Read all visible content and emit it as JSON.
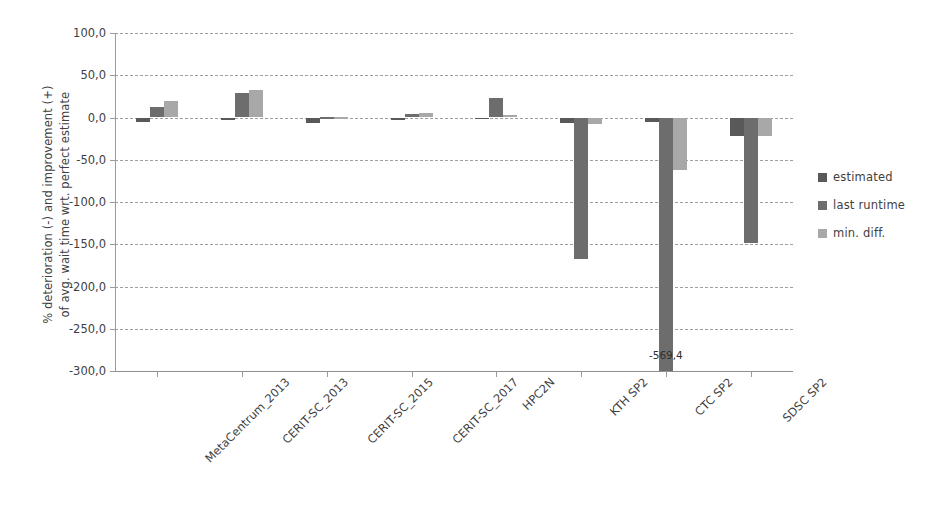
{
  "chart_data": {
    "type": "bar",
    "title": "",
    "xlabel": "",
    "ylabel_line1": "% deterioration (-) and improvement (+)",
    "ylabel_line2": "of  avg. wait time wrt. perfect estimate",
    "ylim": [
      -300.0,
      100.0
    ],
    "ytick_step": 50.0,
    "ytick_labels": [
      "100,0",
      "50,0",
      "0,0",
      "-50,0",
      "-100,0",
      "-150,0",
      "-200,0",
      "-250,0",
      "-300,0"
    ],
    "ytick_values": [
      100.0,
      50.0,
      0.0,
      -50.0,
      -100.0,
      -150.0,
      -200.0,
      -250.0,
      -300.0
    ],
    "grid": true,
    "grid_style": "dashed",
    "legend_position": "right",
    "decimal_separator": ",",
    "categories": [
      "MetaCentrum_2013",
      "CERIT-SC_2013",
      "CERIT-SC_2015",
      "CERIT-SC_2017",
      "HPC2N",
      "KTH SP2",
      "CTC SP2",
      "SDSC SP2"
    ],
    "series": [
      {
        "name": "estimated",
        "color": "#595959",
        "values": [
          -5.0,
          -2.5,
          -6.5,
          -2.5,
          -1.5,
          -6.0,
          -5.5,
          -22.0
        ]
      },
      {
        "name": "last runtime",
        "color": "#6d6d6d",
        "values": [
          12.0,
          29.0,
          0.5,
          4.0,
          23.0,
          -168.0,
          -569.4,
          -149.0
        ]
      },
      {
        "name": "min. diff.",
        "color": "#a8a8a8",
        "values": [
          20.0,
          33.0,
          0.5,
          5.0,
          3.0,
          -8.0,
          -62.0,
          -22.0
        ]
      }
    ],
    "annotations": [
      {
        "text": "-569,4",
        "category": "CTC SP2",
        "series": "last runtime",
        "note": "bar clipped at axis minimum"
      }
    ]
  },
  "legend": {
    "items": [
      {
        "label": "estimated",
        "color": "#595959"
      },
      {
        "label": "last runtime",
        "color": "#6d6d6d"
      },
      {
        "label": "min. diff.",
        "color": "#a8a8a8"
      }
    ]
  }
}
